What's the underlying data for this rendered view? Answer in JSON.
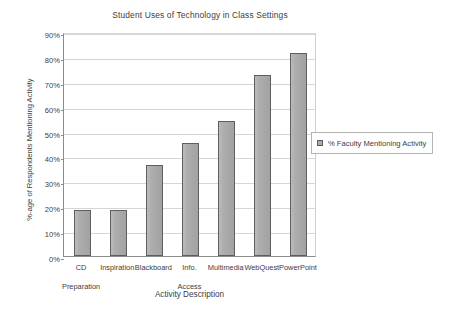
{
  "chart_data": {
    "type": "bar",
    "title": "Student Uses of Technology in Class Settings",
    "xlabel": "Activity Description",
    "ylabel": "%-age of Respondents Mentioning Activity",
    "categories": [
      "CD Preparation",
      "Inspiration",
      "Blackboard",
      "Info. Access",
      "Multimedia",
      "WebQuest",
      "PowerPoint"
    ],
    "category_lines": [
      [
        "CD",
        "Preparation"
      ],
      [
        "Inspiration",
        ""
      ],
      [
        "Blackboard",
        ""
      ],
      [
        "Info.",
        "Access"
      ],
      [
        "Multimedia",
        ""
      ],
      [
        "WebQuest",
        ""
      ],
      [
        "PowerPoint",
        ""
      ]
    ],
    "values": [
      18.5,
      18.5,
      36.5,
      45.4,
      54.3,
      72.8,
      81.6
    ],
    "ylim": [
      0,
      90
    ],
    "ytick_values": [
      0,
      10,
      20,
      30,
      40,
      50,
      60,
      70,
      80,
      90
    ],
    "ytick_labels": [
      "0%",
      "10%",
      "20%",
      "30%",
      "40%",
      "50%",
      "60%",
      "70%",
      "80%",
      "90%"
    ],
    "grid": true,
    "legend_position": "right",
    "legend": [
      {
        "label": "% Faculty Mentioning Activity",
        "swatch_name": "legend-swatch-faculty",
        "color": "#a9a9a9"
      }
    ],
    "series": [
      {
        "name": "% Faculty Mentioning Activity",
        "values": [
          18.5,
          18.5,
          36.5,
          45.4,
          54.3,
          72.8,
          81.6
        ]
      }
    ],
    "colors": {
      "bar_fill": "#a9a9a9",
      "bar_border": "#5e5e5e",
      "gridline": "#d5d5d5",
      "axis": "#8c8c8c",
      "background": "#ffffff",
      "text": "#404040"
    }
  }
}
